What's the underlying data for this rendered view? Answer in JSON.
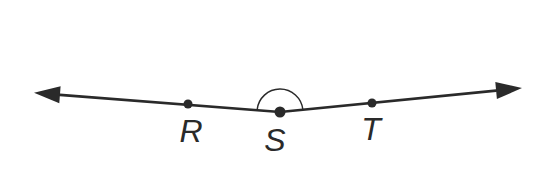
{
  "figure": {
    "type": "geometry-angle-diagram",
    "background": "#ffffff",
    "stroke_color": "#2a2a2a",
    "label_color": "#2a2a2a",
    "points": [
      {
        "id": "R",
        "label": "R",
        "x": 188,
        "y": 104
      },
      {
        "id": "S",
        "label": "S",
        "x": 280,
        "y": 112
      },
      {
        "id": "T",
        "label": "T",
        "x": 372,
        "y": 103
      }
    ],
    "angle": {
      "vertex": "S",
      "rays_through": [
        "R",
        "T"
      ],
      "arc_radius": 23,
      "approx_degrees": 169
    },
    "svg": {
      "left_ray": "M 280 112 L 59.9 94.8",
      "right_ray": "M 280 112 L 496.1 90.6",
      "left_arrowhead": "M 34 92.8 L 60.6 86.3 L 59.3 103.3 Z",
      "right_arrowhead": "M 522 88 L 495.3 82.1 L 496.9 99 Z",
      "angle_arc": "M 257.1 110 A 23 23 0 0 1 302.9 109.8",
      "dot_r": "M 188 104 m -4.5 0 a 4.5 4.5 0 1 0 9 0 a 4.5 4.5 0 1 0 -9 0",
      "dot_s": "M 280 112 m -5.5 0 a 5.5 5.5 0 1 0 11 0 a 5.5 5.5 0 1 0 -11 0",
      "dot_t": "M 372 103 m -4.5 0 a 4.5 4.5 0 1 0 9 0 a 4.5 4.5 0 1 0 -9 0",
      "line_width": "2.7",
      "arc_width": "1.5",
      "label_positions": {
        "r": {
          "x": 191,
          "y": 142
        },
        "s": {
          "x": 275,
          "y": 151
        },
        "t": {
          "x": 371,
          "y": 140
        }
      }
    }
  }
}
